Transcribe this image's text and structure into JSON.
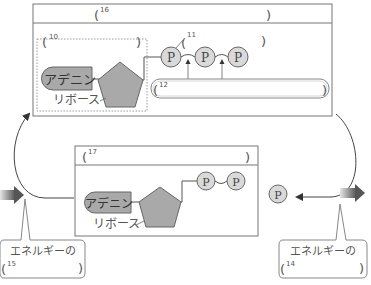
{
  "diagram": {
    "type": "ATP-ADP cycle",
    "colors": {
      "stroke": "#666666",
      "shape_fill": "#a9a9a9",
      "phosphate_fill": "#d9d9d9",
      "arrow_dark": "#555555",
      "arrow_light": "#e0e0e0"
    },
    "top_box": {
      "header_blank_number": "16",
      "dotted_group_blank_number": "10",
      "phosphate_group_blank_number": "11",
      "bond_blank_number": "12",
      "adenine_label": "アデニン",
      "ribose_label": "リボース",
      "phosphates": [
        "P",
        "P",
        "P"
      ]
    },
    "bottom_box": {
      "header_blank_number": "17",
      "adenine_label": "アデニン",
      "ribose_label": "リボース",
      "phosphates": [
        "P",
        "P"
      ]
    },
    "free_phosphate": "P",
    "left_callout": {
      "text": "エネルギーの",
      "blank_number": "15"
    },
    "right_callout": {
      "text": "エネルギーの",
      "blank_number": "14"
    }
  }
}
